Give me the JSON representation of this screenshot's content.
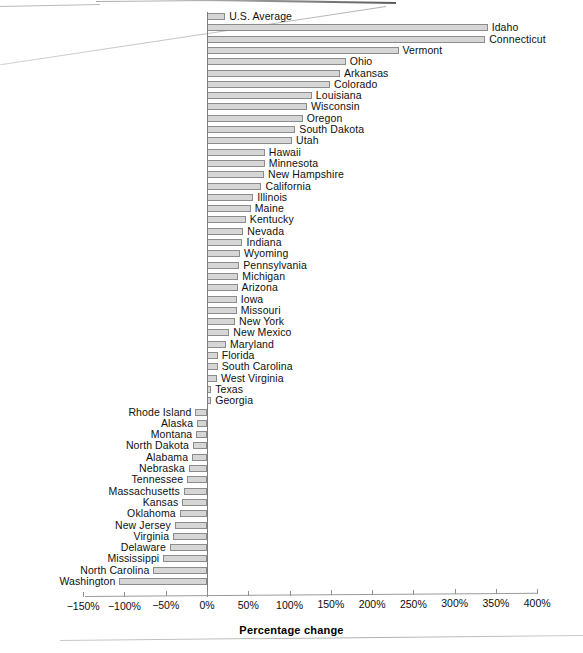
{
  "chart_data": {
    "type": "bar",
    "orientation": "horizontal",
    "title": "",
    "subtitle": "",
    "xlabel": "Percentage change",
    "ylabel": "",
    "xlim": [
      -150,
      400
    ],
    "xticks": [
      -150,
      -100,
      -50,
      0,
      50,
      100,
      150,
      200,
      250,
      300,
      350,
      400
    ],
    "xtick_labels": [
      "−150%",
      "−100%",
      "−50%",
      "0%",
      "50%",
      "100%",
      "150%",
      "200%",
      "250%",
      "300%",
      "350%",
      "400%"
    ],
    "grid": false,
    "legend": null,
    "units": "percent",
    "bar_color": "#d6d6d6",
    "bar_edge_color": "#8c8c8c",
    "zero_line_color": "#7d7d7d",
    "axis_color": "#9a9a9a",
    "categories": [
      "U.S. Average",
      "Idaho",
      "Connecticut",
      "Vermont",
      "Ohio",
      "Arkansas",
      "Colorado",
      "Louisiana",
      "Wisconsin",
      "Oregon",
      "South Dakota",
      "Utah",
      "Hawaii",
      "Minnesota",
      "New Hampshire",
      "California",
      "Illinois",
      "Maine",
      "Kentucky",
      "Nevada",
      "Indiana",
      "Wyoming",
      "Pennsylvania",
      "Michigan",
      "Arizona",
      "Iowa",
      "Missouri",
      "New York",
      "New Mexico",
      "Maryland",
      "Florida",
      "South Carolina",
      "West Virginia",
      "Texas",
      "Georgia",
      "Rhode Island",
      "Alaska",
      "Montana",
      "North Dakota",
      "Alabama",
      "Nebraska",
      "Tennessee",
      "Massachusetts",
      "Kansas",
      "Oklahoma",
      "New Jersey",
      "Virginia",
      "Delaware",
      "Mississippi",
      "North Carolina",
      "Washington"
    ],
    "values": [
      22,
      340,
      337,
      232,
      168,
      161,
      149,
      127,
      121,
      116,
      107,
      103,
      70,
      70,
      69,
      66,
      56,
      53,
      47,
      44,
      43,
      40,
      39,
      38,
      37,
      36,
      36,
      34,
      27,
      23,
      13,
      13,
      12,
      5,
      5,
      -14,
      -12,
      -13,
      -17,
      -18,
      -22,
      -24,
      -28,
      -30,
      -33,
      -39,
      -41,
      -45,
      -53,
      -65,
      -106
    ]
  }
}
